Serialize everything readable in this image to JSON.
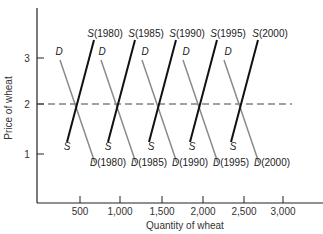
{
  "chart_data": {
    "type": "line",
    "title": "",
    "xlabel": "Quantity of wheat",
    "ylabel": "Price of wheat",
    "xlim": [
      0,
      3400
    ],
    "ylim": [
      0,
      3.9
    ],
    "x_ticks": [
      "500",
      "1,000",
      "1,500",
      "2,000",
      "2,500",
      "3,000"
    ],
    "y_ticks": [
      "1",
      "2",
      "3"
    ],
    "grid": false,
    "reference_line": {
      "type": "horizontal-dashed",
      "y": 2
    },
    "series": [
      {
        "name": "S(1980)",
        "kind": "supply",
        "points": [
          [
            400,
            1.25
          ],
          [
            730,
            3.4
          ]
        ]
      },
      {
        "name": "D(1980)",
        "kind": "demand",
        "top_label": "D",
        "points": [
          [
            280,
            2.95
          ],
          [
            710,
            0.85
          ]
        ]
      },
      {
        "name": "S(1985)",
        "kind": "supply",
        "points": [
          [
            900,
            1.25
          ],
          [
            1230,
            3.4
          ]
        ]
      },
      {
        "name": "D(1985)",
        "kind": "demand",
        "top_label": "D",
        "points": [
          [
            780,
            2.95
          ],
          [
            1210,
            0.85
          ]
        ]
      },
      {
        "name": "S(1990)",
        "kind": "supply",
        "points": [
          [
            1400,
            1.25
          ],
          [
            1730,
            3.4
          ]
        ]
      },
      {
        "name": "D(1990)",
        "kind": "demand",
        "top_label": "D",
        "points": [
          [
            1280,
            2.95
          ],
          [
            1710,
            0.85
          ]
        ]
      },
      {
        "name": "S(1995)",
        "kind": "supply",
        "points": [
          [
            1900,
            1.25
          ],
          [
            2230,
            3.4
          ]
        ]
      },
      {
        "name": "D(1995)",
        "kind": "demand",
        "top_label": "D",
        "points": [
          [
            1780,
            2.95
          ],
          [
            2210,
            0.85
          ]
        ]
      },
      {
        "name": "S(2000)",
        "kind": "supply",
        "points": [
          [
            2400,
            1.25
          ],
          [
            2730,
            3.4
          ]
        ]
      },
      {
        "name": "D(2000)",
        "kind": "demand",
        "top_label": "D",
        "points": [
          [
            2280,
            2.95
          ],
          [
            2710,
            0.85
          ]
        ]
      }
    ],
    "equilibria": [
      [
        500,
        2
      ],
      [
        1000,
        2
      ],
      [
        1500,
        2
      ],
      [
        2000,
        2
      ],
      [
        2500,
        2
      ]
    ],
    "annotations": [
      "S",
      "D",
      "S(1980)",
      "S(1985)",
      "S(1990)",
      "S(1995)",
      "S(2000)",
      "D(1980)",
      "D(1985)",
      "D(1990)",
      "D(1995)",
      "D(2000)"
    ]
  },
  "labels": {
    "xlabel": "Quantity of wheat",
    "ylabel": "Price of wheat",
    "x_ticks": [
      "500",
      "1,000",
      "1,500",
      "2,000",
      "2,500",
      "3,000"
    ],
    "y_ticks": [
      "3",
      "2",
      "1"
    ],
    "S_top": [
      "S(1980)",
      "S(1985)",
      "S(1990)",
      "S(1995)",
      "S(2000)"
    ],
    "D_bottom": [
      "D(1980)",
      "D(1985)",
      "D(1990)",
      "D(1995)",
      "D(2000)"
    ],
    "S_bottom": "S",
    "D_top": "D"
  },
  "colors": {
    "supply": "#111111",
    "demand": "#8a8a8a",
    "axis": "#222222",
    "dashed": "#444444"
  }
}
